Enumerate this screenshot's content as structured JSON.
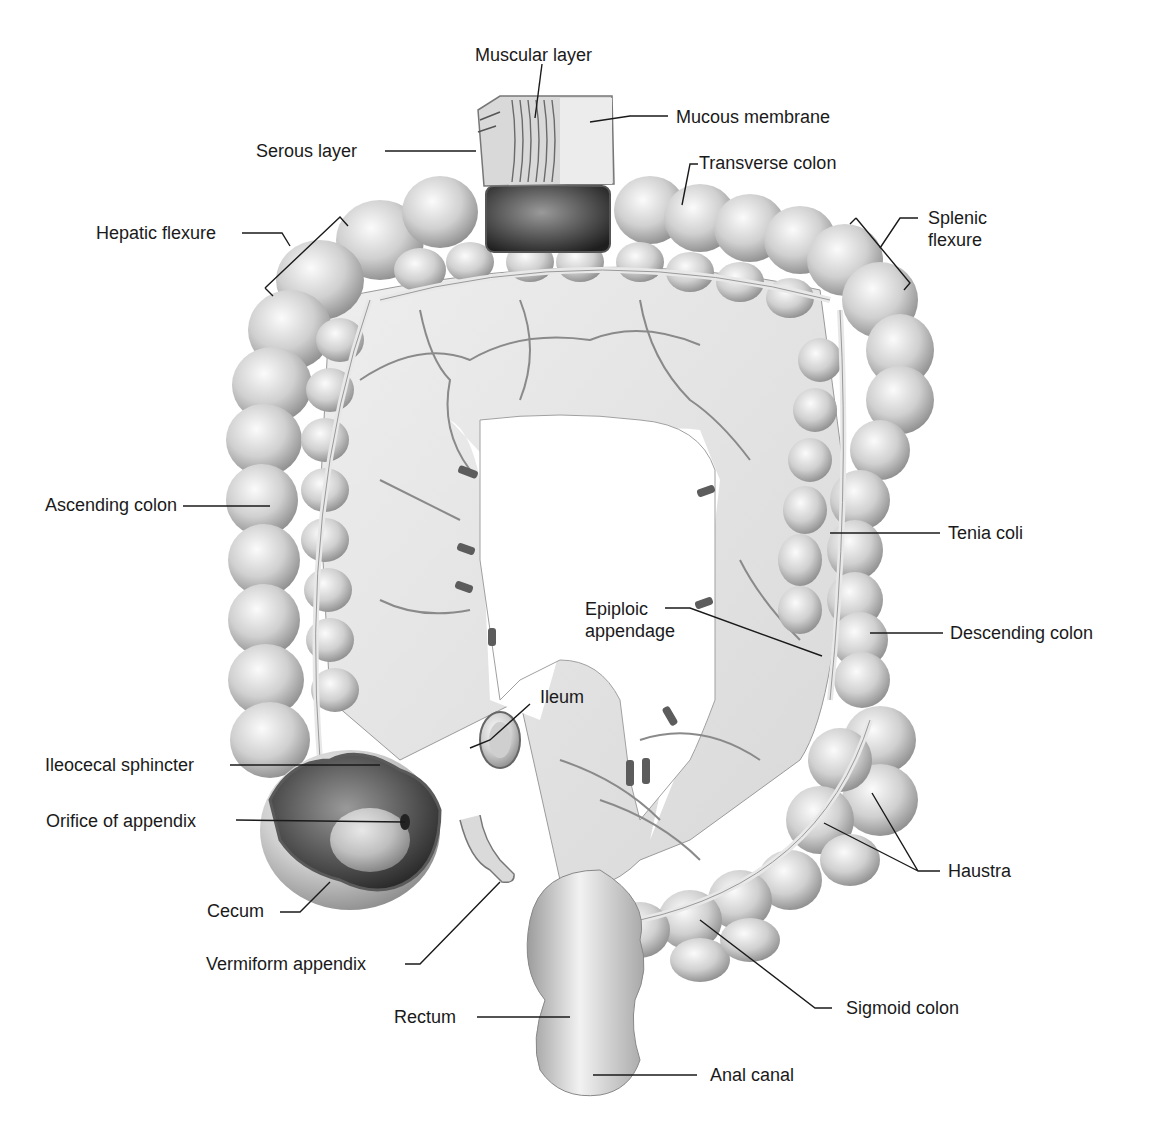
{
  "diagram": {
    "labels": {
      "muscular_layer": "Muscular layer",
      "mucous_membrane": "Mucous membrane",
      "serous_layer": "Serous layer",
      "transverse_colon": "Transverse colon",
      "hepatic_flexure": "Hepatic flexure",
      "splenic_flexure_1": "Splenic",
      "splenic_flexure_2": "flexure",
      "ascending_colon": "Ascending colon",
      "tenia_coli": "Tenia coli",
      "epiploic_appendage_1": "Epiploic",
      "epiploic_appendage_2": "appendage",
      "descending_colon": "Descending colon",
      "ileum": "Ileum",
      "ileocecal_sphincter": "Ileocecal sphincter",
      "orifice_of_appendix": "Orifice of appendix",
      "haustra": "Haustra",
      "cecum": "Cecum",
      "vermiform_appendix": "Vermiform appendix",
      "sigmoid_colon": "Sigmoid colon",
      "rectum": "Rectum",
      "anal_canal": "Anal canal"
    },
    "colors": {
      "background": "#ffffff",
      "tissue_light": "#e6e6e6",
      "tissue_mid": "#bdbdbd",
      "tissue_dark": "#6b6b6b",
      "leader_line": "#1a1a1a"
    }
  }
}
